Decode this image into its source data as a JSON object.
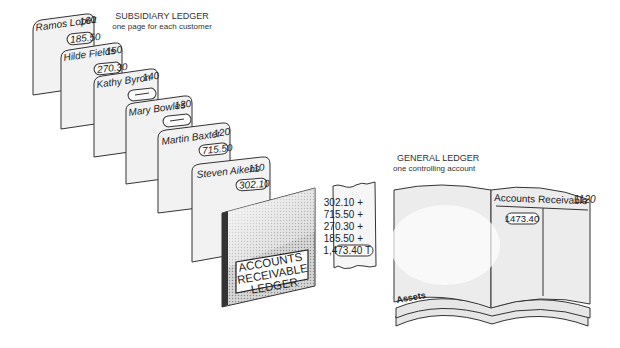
{
  "subsidiary_ledger": {
    "title": "SUBSIDIARY LEDGER",
    "subtitle": "one page for each customer",
    "pages": [
      {
        "name": "Ramos Lopez",
        "account": "160",
        "amount": "185.50"
      },
      {
        "name": "Hilde Fields",
        "account": "150",
        "amount": "270.30"
      },
      {
        "name": "Kathy Byron",
        "account": "140",
        "amount": "—"
      },
      {
        "name": "Mary Bowles",
        "account": "130",
        "amount": "—"
      },
      {
        "name": "Martin Baxter",
        "account": "120",
        "amount": "715.50"
      },
      {
        "name": "Steven Aikens",
        "account": "110",
        "amount": "302.10"
      }
    ],
    "cover": {
      "line1": "ACCOUNTS",
      "line2": "RECEIVABLE",
      "line3": "LEDGER"
    }
  },
  "adding_tape": {
    "lines": [
      "302.10 +",
      "715.50 +",
      "270.30 +",
      "185.50 +"
    ],
    "total": "1,473.40 T"
  },
  "general_ledger": {
    "title": "GENERAL LEDGER",
    "subtitle": "one controlling account",
    "account_title": "Accounts Receivable",
    "account_number": "1120",
    "balance": "1473.40",
    "section_tab": "Assets"
  }
}
